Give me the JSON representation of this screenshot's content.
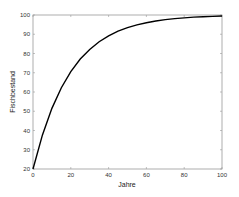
{
  "chart_data": {
    "type": "line",
    "title": "",
    "xlabel": "Jahre",
    "ylabel": "Fischbestand",
    "xlim": [
      0,
      100
    ],
    "ylim": [
      20,
      100
    ],
    "xticks": [
      "0",
      "20",
      "40",
      "60",
      "80",
      "100"
    ],
    "yticks": [
      "20",
      "30",
      "40",
      "50",
      "60",
      "70",
      "80",
      "90",
      "100"
    ],
    "grid": false,
    "legend": null,
    "series": [
      {
        "name": "Fischbestand",
        "color": "#000000",
        "x": [
          0,
          5,
          10,
          15,
          20,
          25,
          30,
          35,
          40,
          45,
          50,
          55,
          60,
          65,
          70,
          75,
          80,
          85,
          90,
          95,
          100
        ],
        "y": [
          20,
          37.7,
          51.5,
          62.2,
          70.6,
          77.1,
          82.1,
          86.1,
          89.2,
          91.6,
          93.4,
          94.9,
          96.0,
          96.9,
          97.6,
          98.1,
          98.5,
          98.9,
          99.1,
          99.3,
          99.5
        ]
      }
    ]
  }
}
